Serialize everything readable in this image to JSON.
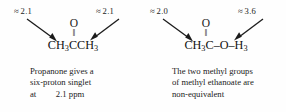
{
  "figure": {
    "background_color": "#fefefe",
    "text_color": "#1b1b1b"
  },
  "panels": [
    {
      "id": "propanone",
      "labels": {
        "left": {
          "approx": "≈",
          "value": "2.1"
        },
        "right": {
          "approx": "≈",
          "value": "2.1"
        }
      },
      "structure": {
        "oxygen": "O",
        "double_bond": "‖",
        "chain": "CH3CCH3",
        "chain_parts": [
          {
            "text": "CH",
            "sub": false
          },
          {
            "text": "3",
            "sub": true
          },
          {
            "text": "CCH",
            "sub": false
          },
          {
            "text": "3",
            "sub": true
          }
        ]
      },
      "caption_lines": [
        "Propanone gives a",
        "six-proton singlet",
        "at   2.1 ppm"
      ],
      "caption": "Propanone gives a six-proton singlet at 2.1 ppm"
    },
    {
      "id": "methyl-ethanoate",
      "labels": {
        "left": {
          "approx": "≈",
          "value": "2.0"
        },
        "right": {
          "approx": "≈",
          "value": "3.6"
        }
      },
      "structure": {
        "oxygen": "O",
        "double_bond": "‖",
        "chain": "CH3C–O–H3",
        "chain_parts": [
          {
            "text": "CH",
            "sub": false
          },
          {
            "text": "3",
            "sub": true
          },
          {
            "text": "C–O–H",
            "sub": false
          },
          {
            "text": "3",
            "sub": true
          }
        ]
      },
      "caption_lines": [
        "The two methyl groups",
        "of methyl ethanoate are",
        "non-equivalent"
      ],
      "caption": "The two methyl groups of methyl ethanoate are non-equivalent"
    }
  ],
  "icons": {
    "arrow_down_right": "arrow-down-right-icon",
    "arrow_down_left": "arrow-down-left-icon"
  }
}
